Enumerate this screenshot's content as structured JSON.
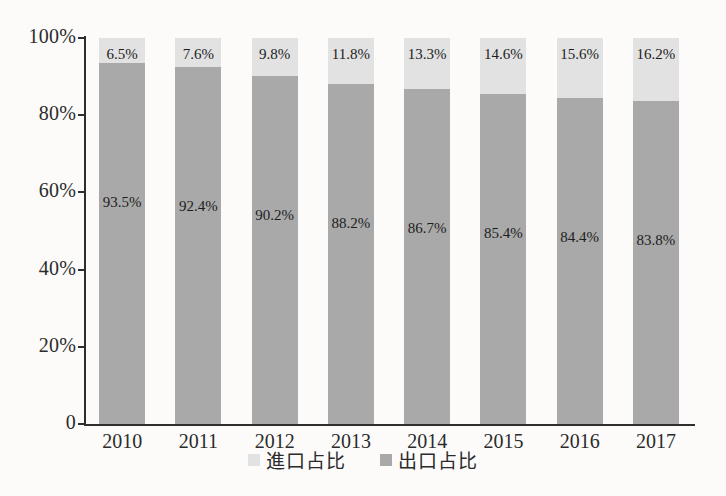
{
  "chart_data": {
    "type": "bar",
    "title": "",
    "subtitle": "",
    "xlabel": "",
    "ylabel": "",
    "stacked": true,
    "stack_total": 100,
    "grid": false,
    "legend_position": "bottom",
    "categories": [
      "2010",
      "2011",
      "2012",
      "2013",
      "2014",
      "2015",
      "2016",
      "2017"
    ],
    "ylim": [
      0,
      100
    ],
    "yticks": [
      0,
      20,
      40,
      60,
      80,
      100
    ],
    "ytick_labels": [
      "0",
      "20%",
      "40%",
      "60%",
      "80%",
      "100%"
    ],
    "series": [
      {
        "name": "進口占比",
        "color": "#e2e2e2",
        "values": [
          6.5,
          7.6,
          9.8,
          11.8,
          13.3,
          14.6,
          15.6,
          16.2
        ],
        "data_labels": [
          "6.5%",
          "7.6%",
          "9.8%",
          "11.8%",
          "13.3%",
          "14.6%",
          "15.6%",
          "16.2%"
        ]
      },
      {
        "name": "出口占比",
        "color": "#a9a9a9",
        "values": [
          93.5,
          92.4,
          90.2,
          88.2,
          86.7,
          85.4,
          84.4,
          83.8
        ],
        "data_labels": [
          "93.5%",
          "92.4%",
          "90.2%",
          "88.2%",
          "86.7%",
          "85.4%",
          "84.4%",
          "83.8%"
        ]
      }
    ]
  },
  "legend": {
    "items": [
      {
        "label": "進口占比",
        "color": "#e2e2e2"
      },
      {
        "label": "出口占比",
        "color": "#a9a9a9"
      }
    ]
  },
  "colors": {
    "import": "#e2e2e2",
    "export": "#a9a9a9",
    "axis": "#2e2e2e",
    "text": "#2b2b2b",
    "background": "#fcfbfa"
  }
}
